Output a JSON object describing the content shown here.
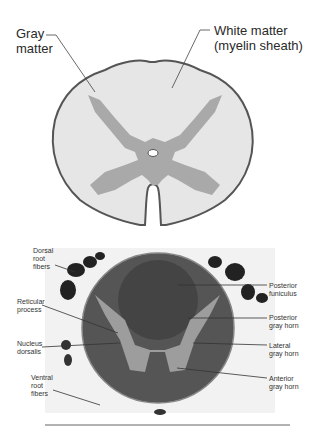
{
  "top_diagram": {
    "labels": {
      "gray_matter_line1": "Gray",
      "gray_matter_line2": "matter",
      "white_matter_line1": "White matter",
      "white_matter_line2": "(myelin sheath)"
    },
    "colors": {
      "white_matter": "#e8e8e8",
      "gray_matter": "#a9a9a9",
      "outline": "#555555"
    }
  },
  "micrograph": {
    "labels_left": [
      {
        "lines": [
          "Dorsal",
          "root",
          "fibers"
        ]
      },
      {
        "lines": [
          "Reticular",
          "process"
        ]
      },
      {
        "lines": [
          "Nucleus",
          "dorsalis"
        ]
      },
      {
        "lines": [
          "Ventral",
          "root",
          "fibers"
        ]
      }
    ],
    "labels_right": [
      {
        "lines": [
          "Posterior",
          "funiculus"
        ]
      },
      {
        "lines": [
          "Posterior",
          "gray horn"
        ]
      },
      {
        "lines": [
          "Lateral",
          "gray horn"
        ]
      },
      {
        "lines": [
          "Anterior",
          "gray horn"
        ]
      }
    ]
  }
}
